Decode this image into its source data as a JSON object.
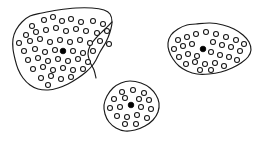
{
  "diagram": {
    "kind": "cluster-scatter-diagram",
    "canvas": {
      "width": 261,
      "height": 141
    },
    "style": {
      "background_color": "#ffffff",
      "outline_color": "#1a1a1a",
      "open_point_fill": "#ffffff",
      "open_point_stroke": "#161616",
      "filled_point_color": "#000000",
      "open_point_radius": 2.5,
      "filled_point_radius": 2.8
    },
    "clusters": [
      {
        "id": "cluster-left",
        "name": "large-left-cluster",
        "outline": [
          [
            42,
            13
          ],
          [
            58,
            10
          ],
          [
            76,
            8
          ],
          [
            92,
            8
          ],
          [
            104,
            10
          ],
          [
            110,
            14
          ],
          [
            112,
            22
          ],
          [
            110,
            32
          ],
          [
            106,
            42
          ],
          [
            100,
            52
          ],
          [
            96,
            60
          ],
          [
            92,
            66
          ],
          [
            86,
            72
          ],
          [
            78,
            78
          ],
          [
            68,
            84
          ],
          [
            58,
            88
          ],
          [
            48,
            90
          ],
          [
            38,
            89
          ],
          [
            30,
            85
          ],
          [
            23,
            78
          ],
          [
            18,
            69
          ],
          [
            15,
            59
          ],
          [
            13,
            49
          ],
          [
            13,
            39
          ],
          [
            16,
            30
          ],
          [
            22,
            22
          ],
          [
            30,
            16
          ]
        ],
        "inner_notch": [
          [
            112,
            22
          ],
          [
            104,
            30
          ],
          [
            96,
            38
          ],
          [
            90,
            46
          ],
          [
            88,
            54
          ],
          [
            90,
            62
          ],
          [
            94,
            70
          ],
          [
            96,
            78
          ]
        ],
        "filled_point": [
          63,
          51
        ],
        "open_points": [
          [
            32,
            26
          ],
          [
            44,
            20
          ],
          [
            53,
            17
          ],
          [
            62,
            21
          ],
          [
            71,
            19
          ],
          [
            81,
            22
          ],
          [
            93,
            21
          ],
          [
            103,
            24
          ],
          [
            26,
            35
          ],
          [
            36,
            32
          ],
          [
            46,
            30
          ],
          [
            56,
            28
          ],
          [
            66,
            31
          ],
          [
            76,
            29
          ],
          [
            86,
            31
          ],
          [
            97,
            33
          ],
          [
            107,
            31
          ],
          [
            19,
            43
          ],
          [
            30,
            41
          ],
          [
            40,
            39
          ],
          [
            50,
            42
          ],
          [
            60,
            40
          ],
          [
            70,
            42
          ],
          [
            80,
            40
          ],
          [
            90,
            43
          ],
          [
            100,
            41
          ],
          [
            109,
            44
          ],
          [
            24,
            51
          ],
          [
            35,
            49
          ],
          [
            45,
            52
          ],
          [
            55,
            50
          ],
          [
            73,
            51
          ],
          [
            83,
            53
          ],
          [
            93,
            51
          ],
          [
            28,
            60
          ],
          [
            38,
            58
          ],
          [
            48,
            61
          ],
          [
            58,
            59
          ],
          [
            68,
            61
          ],
          [
            78,
            59
          ],
          [
            88,
            62
          ],
          [
            33,
            69
          ],
          [
            43,
            67
          ],
          [
            53,
            70
          ],
          [
            63,
            68
          ],
          [
            73,
            70
          ],
          [
            83,
            69
          ],
          [
            41,
            78
          ],
          [
            51,
            76
          ],
          [
            61,
            79
          ],
          [
            71,
            77
          ],
          [
            48,
            85
          ]
        ]
      },
      {
        "id": "cluster-right",
        "name": "medium-right-cluster",
        "outline": [
          [
            196,
            24
          ],
          [
            210,
            23
          ],
          [
            223,
            25
          ],
          [
            234,
            29
          ],
          [
            243,
            35
          ],
          [
            249,
            42
          ],
          [
            251,
            50
          ],
          [
            248,
            57
          ],
          [
            241,
            63
          ],
          [
            232,
            68
          ],
          [
            221,
            72
          ],
          [
            209,
            74
          ],
          [
            197,
            74
          ],
          [
            187,
            71
          ],
          [
            179,
            66
          ],
          [
            173,
            59
          ],
          [
            169,
            51
          ],
          [
            168,
            43
          ],
          [
            171,
            35
          ],
          [
            178,
            29
          ],
          [
            187,
            25
          ]
        ],
        "filled_point": [
          203,
          49
        ],
        "open_points": [
          [
            178,
            40
          ],
          [
            187,
            37
          ],
          [
            196,
            34
          ],
          [
            206,
            32
          ],
          [
            216,
            34
          ],
          [
            226,
            37
          ],
          [
            236,
            40
          ],
          [
            244,
            44
          ],
          [
            174,
            49
          ],
          [
            183,
            46
          ],
          [
            192,
            44
          ],
          [
            213,
            42
          ],
          [
            222,
            45
          ],
          [
            231,
            47
          ],
          [
            240,
            51
          ],
          [
            179,
            57
          ],
          [
            188,
            54
          ],
          [
            197,
            56
          ],
          [
            211,
            52
          ],
          [
            220,
            55
          ],
          [
            229,
            57
          ],
          [
            237,
            60
          ],
          [
            186,
            64
          ],
          [
            195,
            62
          ],
          [
            205,
            64
          ],
          [
            215,
            63
          ],
          [
            224,
            66
          ],
          [
            200,
            70
          ],
          [
            211,
            70
          ]
        ]
      },
      {
        "id": "cluster-bottom",
        "name": "small-bottom-cluster",
        "outline": [
          [
            130,
            81
          ],
          [
            141,
            83
          ],
          [
            150,
            88
          ],
          [
            156,
            95
          ],
          [
            159,
            103
          ],
          [
            158,
            112
          ],
          [
            153,
            120
          ],
          [
            145,
            126
          ],
          [
            135,
            130
          ],
          [
            125,
            131
          ],
          [
            116,
            128
          ],
          [
            109,
            122
          ],
          [
            105,
            114
          ],
          [
            104,
            105
          ],
          [
            107,
            96
          ],
          [
            113,
            88
          ],
          [
            121,
            83
          ]
        ],
        "filled_point": [
          131,
          105
        ],
        "open_points": [
          [
            122,
            92
          ],
          [
            133,
            90
          ],
          [
            144,
            93
          ],
          [
            114,
            99
          ],
          [
            125,
            98
          ],
          [
            139,
            99
          ],
          [
            149,
            100
          ],
          [
            110,
            108
          ],
          [
            120,
            107
          ],
          [
            141,
            107
          ],
          [
            151,
            109
          ],
          [
            117,
            116
          ],
          [
            127,
            117
          ],
          [
            137,
            115
          ],
          [
            147,
            118
          ],
          [
            125,
            124
          ],
          [
            136,
            124
          ]
        ]
      }
    ]
  }
}
